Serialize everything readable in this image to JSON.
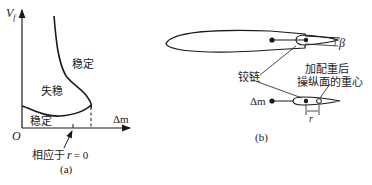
{
  "panel_a": {
    "y_axis_label_main": "V",
    "y_axis_label_sub": "f",
    "x_axis_label": "Δm",
    "origin_label": "O",
    "region_stable_upper": "稳定",
    "region_unstable": "失稳",
    "region_stable_lower": "稳定",
    "annotation_prefix": "相应于",
    "annotation_var": "r",
    "annotation_suffix": "= 0",
    "caption": "(a)"
  },
  "panel_b": {
    "hinge_label": "铰链",
    "cg_label_line1": "加配重后",
    "cg_label_line2": "操纵面的重心",
    "mass_label": "Δm",
    "offset_label": "r",
    "angle_label": "β",
    "caption": "(b)"
  },
  "colors": {
    "ink": "#1a1a1a",
    "background": "#ffffff"
  }
}
